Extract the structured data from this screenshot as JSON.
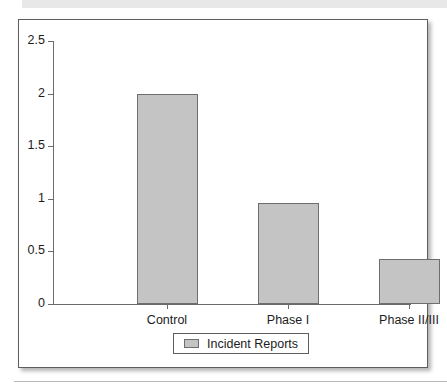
{
  "chart_data": {
    "type": "bar",
    "title": "",
    "subtitle": "",
    "xlabel": "",
    "ylabel": "",
    "categories": [
      "Control",
      "Phase I",
      "Phase II/III"
    ],
    "series": [
      {
        "name": "Incident Reports",
        "values": [
          2.0,
          0.96,
          0.43
        ]
      }
    ],
    "ylim": [
      0,
      2.5
    ],
    "ytick_labels": [
      "0",
      "0.5",
      "1",
      "1.5",
      "2",
      "2.5"
    ],
    "ytick_values": [
      0,
      0.5,
      1,
      1.5,
      2,
      2.5
    ],
    "grid": false,
    "legend_position": "bottom",
    "legend_entries": [
      "Incident Reports"
    ],
    "colors": {
      "bar_fill": "#c4c4c4",
      "bar_border": "#6e6e6e",
      "axis": "#6b6b6b",
      "frame": "#5d5d5d",
      "text": "#1c1c1c",
      "top_band": "#e8e8e8",
      "bottom_rule": "#b8b8b8",
      "plot_background": "#ffffff"
    }
  }
}
